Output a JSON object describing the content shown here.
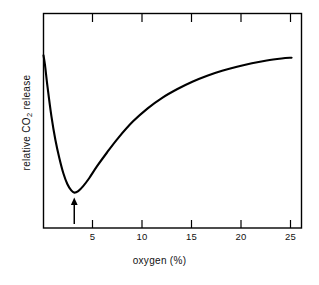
{
  "figure": {
    "background_color": "#ffffff",
    "line_color": "#000000"
  },
  "axis_titles": {
    "x": "oxygen (%)",
    "y_prefix": "relative CO",
    "y_subscript": "2",
    "y_suffix": " release"
  },
  "annotation": {
    "arrow_label": "minimum-marker-arrow",
    "arrow_x_value": 3.1
  },
  "chart_data": {
    "type": "line",
    "title": "",
    "subtitle": "",
    "xlabel": "oxygen (%)",
    "ylabel": "relative CO2 release",
    "xlim": [
      0,
      26
    ],
    "ylim": [
      0,
      1
    ],
    "grid": false,
    "legend": null,
    "x_ticks": [
      5,
      10,
      15,
      20,
      25
    ],
    "x_tick_labels": [
      "5",
      "10",
      "15",
      "20",
      "25"
    ],
    "y_ticks": [],
    "y_tick_labels": [],
    "axis_style": "box-frame-with-inward-ticks-top-and-bottom",
    "annotations": [
      {
        "type": "arrow",
        "direction": "up",
        "x": 3.1,
        "note": "marks the minimum of the curve (extinction point)"
      }
    ],
    "series": [
      {
        "name": "relative CO2 release",
        "x": [
          0.0,
          0.15,
          0.4,
          0.8,
          1.2,
          1.6,
          2.0,
          2.4,
          2.8,
          3.1,
          3.5,
          4.0,
          4.6,
          5.4,
          6.4,
          7.5,
          9.0,
          10.5,
          12.0,
          13.5,
          15.0,
          16.5,
          18.0,
          19.5,
          21.0,
          22.5,
          24.0,
          25.0
        ],
        "y": [
          0.805,
          0.76,
          0.66,
          0.52,
          0.41,
          0.325,
          0.255,
          0.205,
          0.175,
          0.165,
          0.172,
          0.195,
          0.232,
          0.288,
          0.352,
          0.418,
          0.496,
          0.558,
          0.608,
          0.648,
          0.682,
          0.71,
          0.733,
          0.752,
          0.768,
          0.781,
          0.79,
          0.794
        ]
      }
    ]
  }
}
